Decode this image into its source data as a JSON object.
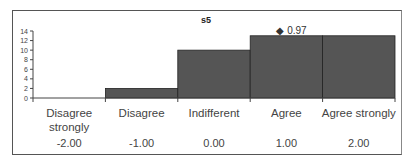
{
  "chart_data": {
    "type": "bar",
    "title": "s5",
    "categories": [
      "Disagree strongly",
      "Disagree",
      "Indifferent",
      "Agree",
      "Agree strongly"
    ],
    "category_lines": [
      [
        "Disagree",
        "strongly"
      ],
      [
        "Disagree"
      ],
      [
        "Indifferent"
      ],
      [
        "Agree"
      ],
      [
        "Agree strongly"
      ]
    ],
    "values": [
      0,
      2,
      10,
      13,
      13
    ],
    "scale_values": [
      "-2.00",
      "-1.00",
      "0.00",
      "1.00",
      "2.00"
    ],
    "annotation": {
      "marker": "◆",
      "text": "0.97",
      "category": "Agree"
    },
    "xlabel": "",
    "ylabel": "",
    "ylim": [
      0,
      14
    ],
    "yticks": [
      0,
      2,
      4,
      6,
      8,
      10,
      12,
      14
    ],
    "bar_color": "#555555",
    "grid": false,
    "legend": "none"
  }
}
